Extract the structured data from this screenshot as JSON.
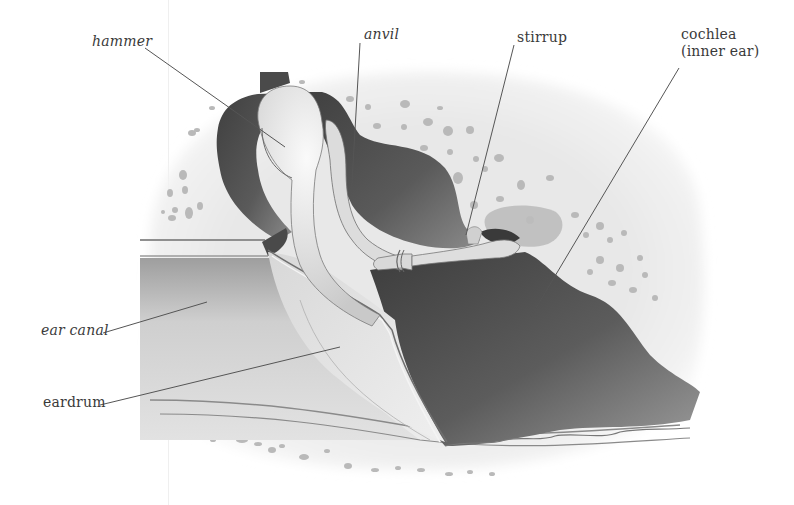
{
  "diagram": {
    "colors": {
      "background": "#ffffff",
      "bone_light": "#e9e9e9",
      "cavity_dark": "#4e4e4e",
      "canal": "#cfcfcf",
      "ossicle": "#e2e2e2",
      "leader_line": "#555555",
      "label_text": "#3a3a3a"
    },
    "labels": [
      {
        "id": "hammer",
        "text": "hammer",
        "x": 92,
        "y": 34,
        "line": [
          145,
          48,
          285,
          147
        ]
      },
      {
        "id": "anvil",
        "text": "anvil",
        "x": 363,
        "y": 27,
        "line": [
          360,
          43,
          351,
          200
        ]
      },
      {
        "id": "stirrup",
        "text": "stirrup",
        "x": 517,
        "y": 30,
        "line": [
          514,
          45,
          466,
          235
        ]
      },
      {
        "id": "cochlea",
        "text": "cochlea",
        "text2": "(inner ear)",
        "x": 681,
        "y": 29,
        "line": [
          679,
          68,
          530,
          318
        ]
      },
      {
        "id": "ear-canal",
        "text": "ear canal",
        "x": 41,
        "y": 322,
        "line": [
          103,
          333,
          207,
          302
        ]
      },
      {
        "id": "eardrum",
        "text": "eardrum",
        "x": 43,
        "y": 394,
        "line": [
          100,
          405,
          340,
          347
        ]
      }
    ]
  }
}
